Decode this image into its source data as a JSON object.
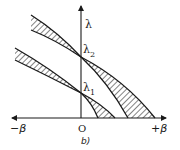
{
  "figure": {
    "caption": "b)",
    "y_axis_label": "λ",
    "x_axis_left_label": "−β",
    "x_axis_right_label": "+β",
    "origin_label": "O",
    "points": [
      {
        "label": "λ",
        "subscript": "1"
      },
      {
        "label": "λ",
        "subscript": "2"
      }
    ]
  },
  "colors": {
    "line": "#1a1a1a",
    "background": "#ffffff"
  }
}
